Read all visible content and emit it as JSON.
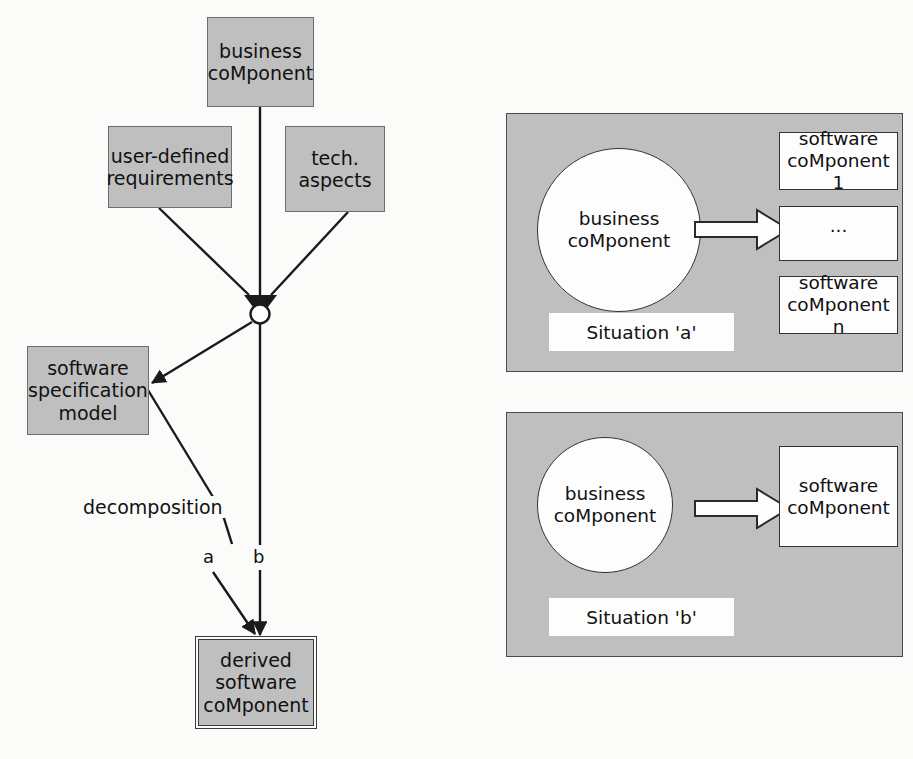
{
  "figure": {
    "left_diagram": {
      "nodes": {
        "business_component": "business\ncoMponent",
        "user_defined_requirements": "user-defined\nrequirements",
        "tech_aspects": "tech.\naspects",
        "software_specification_model": "software\nspecification\nmodel",
        "derived_software_component": "derived\nsoftware\ncoMponent"
      },
      "edge_labels": {
        "decomposition": "decomposition",
        "branch_a": "a",
        "branch_b": "b"
      }
    },
    "situation_a": {
      "caption": "Situation 'a'",
      "source": "business\ncoMponent",
      "targets": [
        "software\ncoMponent 1",
        "...",
        "software\ncoMponent n"
      ]
    },
    "situation_b": {
      "caption": "Situation 'b'",
      "source": "business\ncoMponent",
      "targets": [
        "software\ncoMponent"
      ]
    },
    "colors": {
      "box_fill": "#bfbfbf",
      "box_stroke": "#6e6e6e",
      "panel_fill": "#bfbfbf",
      "panel_stroke": "#4a4a4a",
      "white_fill": "#fdfdfd",
      "line": "#1a1a1a"
    }
  }
}
